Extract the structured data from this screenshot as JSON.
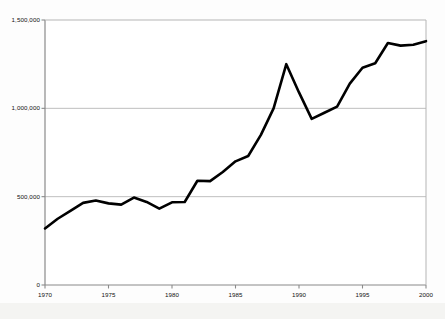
{
  "chart_data": {
    "type": "line",
    "title": "",
    "subtitle": "",
    "xlabel": "",
    "ylabel": "",
    "xlim": [
      1970,
      2000
    ],
    "ylim": [
      0,
      1500000
    ],
    "grid": "horizontal gridlines at 500,000 and 1,000,000",
    "legend": "none",
    "legend_position": "none",
    "line_color": "#000000",
    "line_width_px": 2.6,
    "gridline_color": "#bfbfbf",
    "axis_color": "#808080",
    "background_color": "#fdfdfd",
    "y_ticks": [
      0,
      500000,
      1000000,
      1500000
    ],
    "y_tick_labels": [
      "0",
      "500,000",
      "1,000,000",
      "1,500,000"
    ],
    "x_ticks": [
      1970,
      1975,
      1980,
      1985,
      1990,
      1995,
      2000
    ],
    "x_tick_labels": [
      "1970",
      "1975",
      "1980",
      "1985",
      "1990",
      "1995",
      "2000"
    ],
    "x": [
      1970,
      1971,
      1972,
      1973,
      1974,
      1975,
      1976,
      1977,
      1978,
      1979,
      1980,
      1981,
      1982,
      1983,
      1984,
      1985,
      1986,
      1987,
      1988,
      1989,
      1990,
      1991,
      1992,
      1993,
      1994,
      1995,
      1996,
      1997,
      1998,
      1999,
      2000
    ],
    "series": [
      {
        "name": "value",
        "values": [
          320000,
          375000,
          420000,
          465000,
          478000,
          462000,
          455000,
          495000,
          470000,
          432000,
          468000,
          470000,
          590000,
          588000,
          640000,
          700000,
          730000,
          850000,
          1000000,
          1250000,
          1090000,
          940000,
          975000,
          1010000,
          1140000,
          1230000,
          1255000,
          1370000,
          1355000,
          1360000,
          1380000
        ]
      }
    ]
  },
  "axis": {
    "y_labels": [
      "1,500,000",
      "1,000,000",
      "500,000",
      "0"
    ],
    "x_labels": [
      "1970",
      "1975",
      "1980",
      "1985",
      "1990",
      "1995",
      "2000"
    ]
  }
}
